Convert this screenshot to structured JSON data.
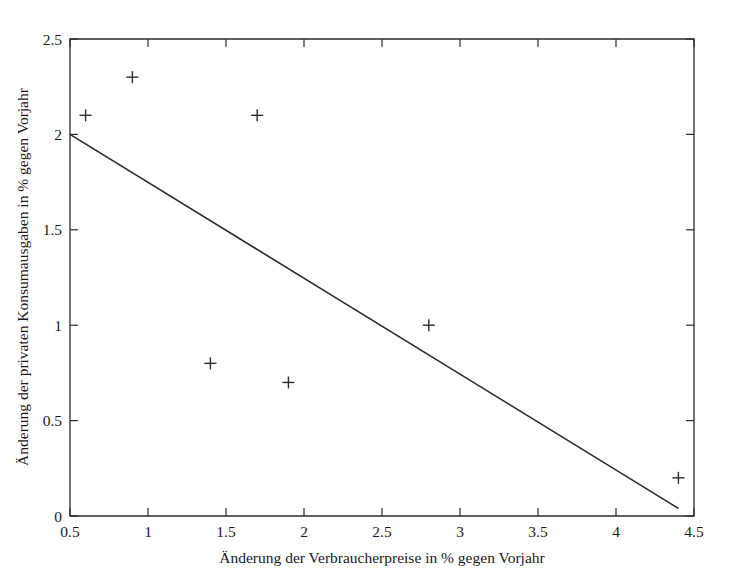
{
  "chart_data": {
    "type": "scatter",
    "title": "",
    "subtitle": "",
    "xlabel": "Änderung der Verbraucherpreise in % gegen Vorjahr",
    "ylabel": "Änderung der privaten Konsumausgaben in % gegen Vorjahr",
    "xlim": [
      0.5,
      4.5
    ],
    "ylim": [
      0,
      2.5
    ],
    "xticks": [
      0.5,
      1,
      1.5,
      2,
      2.5,
      3,
      3.5,
      4,
      4.5
    ],
    "xticklabels": [
      "0.5",
      "1",
      "1.5",
      "2",
      "2.5",
      "3",
      "3.5",
      "4",
      "4.5"
    ],
    "yticks": [
      0,
      0.5,
      1,
      1.5,
      2,
      2.5
    ],
    "yticklabels": [
      "0",
      "0.5",
      "1",
      "1.5",
      "2",
      "2.5"
    ],
    "grid": false,
    "legend": false,
    "legend_position": "none",
    "marker_style": "plus",
    "marker_color": "#2b2b2b",
    "line_color": "#2b2b2b",
    "series": [
      {
        "name": "Beobachtungen",
        "type": "scatter",
        "points": [
          {
            "x": 0.6,
            "y": 2.1
          },
          {
            "x": 0.9,
            "y": 2.3
          },
          {
            "x": 1.4,
            "y": 0.8
          },
          {
            "x": 1.7,
            "y": 2.1
          },
          {
            "x": 1.9,
            "y": 0.7
          },
          {
            "x": 2.8,
            "y": 1.0
          },
          {
            "x": 4.4,
            "y": 0.2
          }
        ]
      },
      {
        "name": "Regressionsgerade",
        "type": "line",
        "points": [
          {
            "x": 0.5,
            "y": 2.0
          },
          {
            "x": 4.4,
            "y": 0.04
          }
        ]
      }
    ]
  },
  "axis": {
    "x_title": "Änderung der Verbraucherpreise in % gegen Vorjahr",
    "y_title": "Änderung der privaten Konsumausgaben in % gegen Vorjahr"
  },
  "ticks": {
    "x": [
      "0.5",
      "1",
      "1.5",
      "2",
      "2.5",
      "3",
      "3.5",
      "4",
      "4.5"
    ],
    "y": [
      "0",
      "0.5",
      "1",
      "1.5",
      "2",
      "2.5"
    ]
  }
}
